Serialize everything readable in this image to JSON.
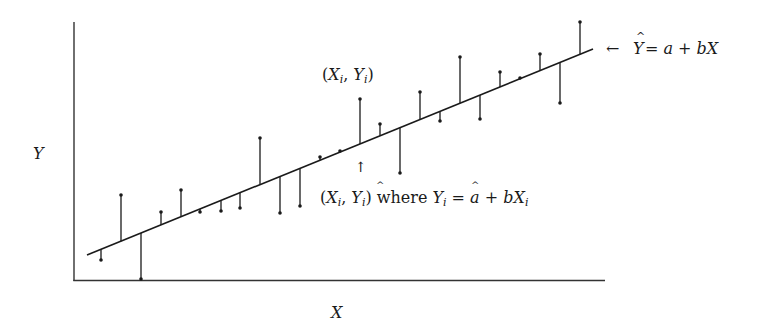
{
  "chart_data": {
    "type": "scatter",
    "title": "",
    "xlabel": "X",
    "ylabel": "Y",
    "grid": false,
    "legend": "none",
    "axis_ticks": "none",
    "regression_line": {
      "a": 19.7,
      "b": 0.407,
      "x_start": 13,
      "x_end": 519,
      "label": "← Ŷ = a + bX"
    },
    "points": [
      {
        "x": 27,
        "y": 20
      },
      {
        "x": 47,
        "y": 85
      },
      {
        "x": 67,
        "y": 1
      },
      {
        "x": 87,
        "y": 68
      },
      {
        "x": 107,
        "y": 90
      },
      {
        "x": 126,
        "y": 68
      },
      {
        "x": 147,
        "y": 69
      },
      {
        "x": 166,
        "y": 72
      },
      {
        "x": 186,
        "y": 142
      },
      {
        "x": 206,
        "y": 67
      },
      {
        "x": 226,
        "y": 74
      },
      {
        "x": 246,
        "y": 123
      },
      {
        "x": 266,
        "y": 129
      },
      {
        "x": 286,
        "y": 181
      },
      {
        "x": 306,
        "y": 156
      },
      {
        "x": 326,
        "y": 107
      },
      {
        "x": 346,
        "y": 188
      },
      {
        "x": 366,
        "y": 159
      },
      {
        "x": 386,
        "y": 223
      },
      {
        "x": 406,
        "y": 161
      },
      {
        "x": 426,
        "y": 208
      },
      {
        "x": 446,
        "y": 202
      },
      {
        "x": 466,
        "y": 226
      },
      {
        "x": 486,
        "y": 177
      },
      {
        "x": 506,
        "y": 258
      }
    ],
    "annotations": [
      {
        "text": "(Xᵢ, Yᵢ)",
        "target": "observed point at x=286"
      },
      {
        "text": "↑",
        "target": "fitted point at x=286"
      },
      {
        "text": "(Xᵢ, Ŷᵢ) where Ŷᵢ = a + bXᵢ",
        "target": "fitted value explanation"
      }
    ],
    "xlim": [
      0,
      531
    ],
    "ylim": [
      0,
      258
    ]
  },
  "labels": {
    "y_axis": "Y",
    "x_axis": "X",
    "line_arrow": "←",
    "line_eq_lhs": "Y",
    "line_eq_rhs": " = a + bX",
    "obs_point": "(Xi, Yi)",
    "fitted_arrow": "↑",
    "fitted_where": "where"
  },
  "style": {
    "ink": "#1a1a1a",
    "axis": "#333333",
    "background": "#ffffff"
  }
}
